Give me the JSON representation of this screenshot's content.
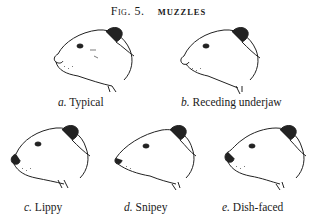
{
  "figure": {
    "number": "Fig. 5.",
    "subject": "MUZZLES"
  },
  "panels": [
    {
      "letter": "a.",
      "label": "Typical"
    },
    {
      "letter": "b.",
      "label": "Receding underjaw"
    },
    {
      "letter": "c.",
      "label": "Lippy"
    },
    {
      "letter": "d.",
      "label": "Snipey"
    },
    {
      "letter": "e.",
      "label": "Dish-faced"
    }
  ]
}
